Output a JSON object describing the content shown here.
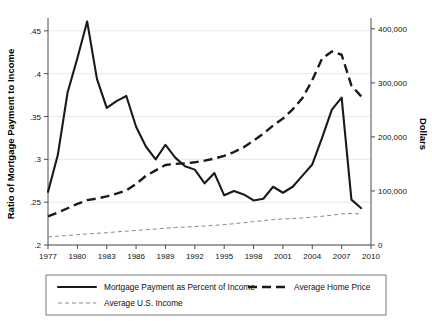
{
  "chart_data": {
    "type": "line",
    "title": "",
    "xlabel": "",
    "ylabel": "Ratio of Mortgage Payment to Income",
    "y2label": "Dollars",
    "xlim": [
      1977,
      2010
    ],
    "ylim": [
      0.2,
      0.465
    ],
    "y2lim": [
      0,
      420000
    ],
    "grid": true,
    "legend_position": "bottom",
    "xticks": [
      "1977",
      "1980",
      "1983",
      "1986",
      "1989",
      "1992",
      "1995",
      "1998",
      "2001",
      "2004",
      "2007",
      "2010"
    ],
    "xtick_values": [
      1977,
      1980,
      1983,
      1986,
      1989,
      1992,
      1995,
      1998,
      2001,
      2004,
      2007,
      2010
    ],
    "yticks": [
      ".45",
      ".4",
      ".35",
      ".3",
      ".25",
      ".2"
    ],
    "ytick_values": [
      0.45,
      0.4,
      0.35,
      0.3,
      0.25,
      0.2
    ],
    "y2ticks": [
      "400,000",
      "300,000",
      "200,000",
      "100,000",
      "0"
    ],
    "y2tick_values": [
      400000,
      300000,
      200000,
      100000,
      0
    ],
    "x": [
      1977,
      1978,
      1979,
      1980,
      1981,
      1982,
      1983,
      1984,
      1985,
      1986,
      1987,
      1988,
      1989,
      1990,
      1991,
      1992,
      1993,
      1994,
      1995,
      1996,
      1997,
      1998,
      1999,
      2000,
      2001,
      2002,
      2003,
      2004,
      2005,
      2006,
      2007,
      2008,
      2009
    ],
    "series": [
      {
        "name": "Mortgage Payment as Percent of Income",
        "axis": "left",
        "style": "solid",
        "color": "#1a1a1a",
        "values": [
          0.262,
          0.305,
          0.378,
          0.418,
          0.461,
          0.394,
          0.36,
          0.368,
          0.374,
          0.338,
          0.315,
          0.3,
          0.317,
          0.302,
          0.292,
          0.288,
          0.272,
          0.284,
          0.258,
          0.263,
          0.259,
          0.252,
          0.254,
          0.268,
          0.261,
          0.268,
          0.281,
          0.294,
          0.325,
          0.358,
          0.372,
          0.253,
          0.243
        ]
      },
      {
        "name": "Average Home Price",
        "axis": "right",
        "style": "dashed",
        "color": "#1a1a1a",
        "values": [
          53000,
          60000,
          68000,
          76000,
          83000,
          86000,
          90000,
          95000,
          101000,
          113000,
          128000,
          138000,
          148000,
          150000,
          151000,
          153000,
          156000,
          160000,
          165000,
          172000,
          181000,
          193000,
          206000,
          221000,
          234000,
          251000,
          272000,
          305000,
          345000,
          358000,
          352000,
          295000,
          275000
        ]
      },
      {
        "name": "Average U.S. Income",
        "axis": "right",
        "style": "thin-dashed",
        "color": "#8a8a8a",
        "values": [
          15000,
          16300,
          17600,
          19000,
          20500,
          21700,
          22800,
          24300,
          25600,
          26900,
          28200,
          29600,
          31000,
          32300,
          33200,
          34200,
          35100,
          36300,
          37800,
          39400,
          41200,
          43200,
          45100,
          47000,
          48200,
          49000,
          50100,
          51500,
          53200,
          55200,
          57500,
          58400,
          57200
        ]
      }
    ],
    "legend": [
      {
        "label": "Mortgage Payment as Percent of Income",
        "style": "solid"
      },
      {
        "label": "Average Home Price",
        "style": "dashed"
      },
      {
        "label": "Average U.S. Income",
        "style": "thin-dashed"
      }
    ]
  }
}
